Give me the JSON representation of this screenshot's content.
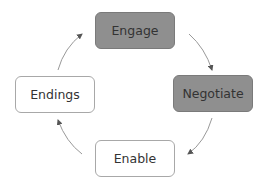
{
  "diagram": {
    "type": "cycle",
    "nodes": [
      {
        "id": "engage",
        "label": "Engage",
        "style": "filled"
      },
      {
        "id": "negotiate",
        "label": "Negotiate",
        "style": "filled"
      },
      {
        "id": "enable",
        "label": "Enable",
        "style": "outline"
      },
      {
        "id": "endings",
        "label": "Endings",
        "style": "outline"
      }
    ],
    "edges": [
      {
        "from": "engage",
        "to": "negotiate"
      },
      {
        "from": "negotiate",
        "to": "enable"
      },
      {
        "from": "enable",
        "to": "endings"
      },
      {
        "from": "endings",
        "to": "engage"
      }
    ],
    "colors": {
      "filled": "#8f8f8f",
      "outline_border": "#a8a8a8",
      "arrow": "#999999",
      "text": "#333333"
    }
  }
}
